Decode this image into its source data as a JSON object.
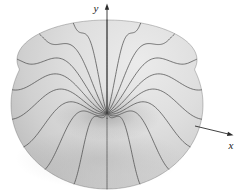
{
  "figure": {
    "background_color": "#ffffff"
  },
  "chart_data": {
    "type": "surface",
    "title": "",
    "x_label": "x",
    "y_label": "y",
    "z_label": "",
    "surface": {
      "profile": "y = h·sin²(π·r/R), 0 ≤ r ≤ R (0 at center, max at rim r = R/2, 0 at outer edge)",
      "meridian_count": 18,
      "azimuth_start_deg": 90,
      "azimuth_step_deg": 20
    },
    "style": {
      "surface_fill_stops": [
        "#ebebeb",
        "#dedede",
        "#d0d0d0",
        "#bdbdbd"
      ],
      "mesh_line_color": "#4d4d4d",
      "axis_color": "#2b2b2b",
      "outline_color": "rgba(70,70,70,0.38)",
      "crater_shadow_color": "#464646"
    },
    "layout": {
      "canvas": [
        249,
        195
      ],
      "center": [
        107,
        104.5
      ],
      "equator_rx": 96,
      "equator_ry": 84.5,
      "upper_cy": 60,
      "upper_rx": 90,
      "upper_ry": 40,
      "rim_lift": 25,
      "pinch_drop": 9,
      "y_axis_top_y": 8,
      "y_arrow_tip": [
        107,
        3.5
      ],
      "x_axis_start": [
        195,
        126
      ],
      "x_axis_end": [
        229,
        134.2
      ],
      "x_arrow_tip": [
        233.5,
        135.3
      ]
    }
  }
}
